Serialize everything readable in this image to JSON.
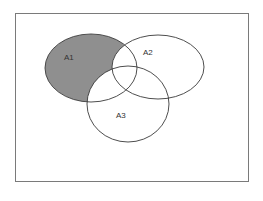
{
  "diagram": {
    "type": "venn",
    "frame": {
      "x": 15,
      "y": 13,
      "width": 233,
      "height": 168,
      "stroke": "#7a7a7a"
    },
    "shaded_region": "A1 \\ (A2 ∪ A3)",
    "colors": {
      "shade": "#8f8f8f",
      "stroke": "#3a3a3a",
      "background": "#ffffff"
    },
    "sets": [
      {
        "id": "A1",
        "label": "A1",
        "cx": 91,
        "cy": 68,
        "rx": 46,
        "ry": 34,
        "label_x": 64,
        "label_y": 60
      },
      {
        "id": "A2",
        "label": "A2",
        "cx": 158,
        "cy": 67,
        "rx": 46,
        "ry": 32,
        "label_x": 143,
        "label_y": 55
      },
      {
        "id": "A3",
        "label": "A3",
        "cx": 128,
        "cy": 104,
        "rx": 41,
        "ry": 38,
        "label_x": 116,
        "label_y": 118
      }
    ]
  }
}
